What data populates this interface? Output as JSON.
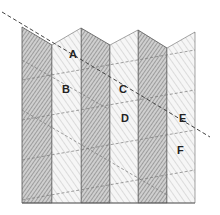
{
  "diagram": {
    "type": "folded-surface-with-hatched-bands",
    "labels": [
      {
        "id": "A",
        "text": "A",
        "x": 72,
        "y": 58
      },
      {
        "id": "B",
        "text": "B",
        "x": 66,
        "y": 93
      },
      {
        "id": "C",
        "text": "C",
        "x": 123,
        "y": 93
      },
      {
        "id": "D",
        "text": "D",
        "x": 125,
        "y": 122
      },
      {
        "id": "E",
        "text": "E",
        "x": 183,
        "y": 122
      },
      {
        "id": "F",
        "text": "F",
        "x": 181,
        "y": 154
      }
    ],
    "colors": {
      "stroke": "#555555",
      "dark_band_fill": "#c8c8c8",
      "light_band_fill": "#f4f4f4",
      "hatch": "#7a7a7a",
      "dashed": "#555555"
    }
  }
}
